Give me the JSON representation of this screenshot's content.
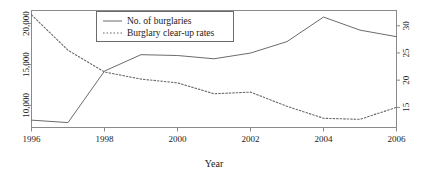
{
  "chart_data": {
    "type": "line",
    "title": "",
    "xlabel": "Year",
    "ylabel": "",
    "x": [
      1996,
      1997,
      1998,
      1999,
      2000,
      2001,
      2002,
      2003,
      2004,
      2005,
      2006
    ],
    "xlim": [
      1996,
      2006
    ],
    "xticks": [
      1996,
      1998,
      2000,
      2002,
      2004,
      2006
    ],
    "xticklabels": [
      "1996",
      "1998",
      "2000",
      "2002",
      "2004",
      "2006"
    ],
    "grid": false,
    "legend_position": "top-center",
    "axes": [
      {
        "id": "left",
        "label": "",
        "ylim": [
          7300,
          21600
        ],
        "yticks": [
          10000,
          15000,
          20000
        ],
        "yticklabels": [
          "10,000",
          "15,000",
          "20,000"
        ],
        "rotated_labels": true
      },
      {
        "id": "right",
        "label": "",
        "ylim": [
          11.3,
          32.8
        ],
        "yticks": [
          15,
          20,
          25,
          30
        ],
        "yticklabels": [
          "15",
          "20",
          "25",
          "30"
        ],
        "rotated_labels": true
      }
    ],
    "series": [
      {
        "name": "No. of burglaries",
        "axis": "left",
        "style": "solid",
        "color": "#6b6b6b",
        "values": [
          8200,
          7900,
          14200,
          16200,
          16100,
          15700,
          16400,
          17800,
          20800,
          19200,
          18400
        ]
      },
      {
        "name": "Burglary clear-up rates",
        "axis": "right",
        "style": "dotted",
        "color": "#6b6b6b",
        "values": [
          32.0,
          25.5,
          21.5,
          20.2,
          19.5,
          17.5,
          17.8,
          15.2,
          13.0,
          12.8,
          15.0
        ]
      }
    ]
  },
  "legend": {
    "items": [
      {
        "label": "No. of burglaries",
        "style": "solid"
      },
      {
        "label": "Burglary clear-up rates",
        "style": "dotted"
      }
    ]
  },
  "axis_titles": {
    "x": "Year"
  },
  "left_axis_ticks": [
    "10,000",
    "15,000",
    "20,000"
  ],
  "right_axis_ticks": [
    "15",
    "20",
    "25",
    "30"
  ],
  "x_axis_ticks": [
    "1996",
    "1998",
    "2000",
    "2002",
    "2004",
    "2006"
  ]
}
